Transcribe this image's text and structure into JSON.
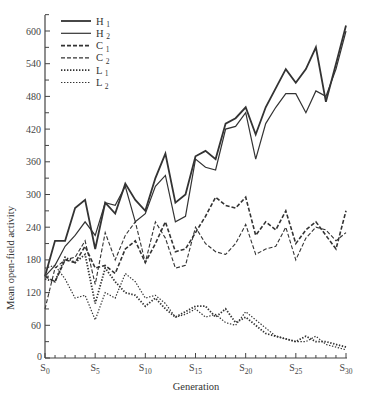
{
  "chart_data": {
    "type": "line",
    "title": "",
    "xlabel": "Generation",
    "ylabel": "Mean open-field activity",
    "x": [
      0,
      1,
      2,
      3,
      4,
      5,
      6,
      7,
      8,
      9,
      10,
      11,
      12,
      13,
      14,
      15,
      16,
      17,
      18,
      19,
      20,
      21,
      22,
      23,
      24,
      25,
      26,
      27,
      28,
      29,
      30
    ],
    "x_tick_labels": [
      {
        "g": 0,
        "base": "S",
        "sub": "0"
      },
      {
        "g": 5,
        "base": "S",
        "sub": "5"
      },
      {
        "g": 10,
        "base": "S",
        "sub": "10"
      },
      {
        "g": 15,
        "base": "S",
        "sub": "15"
      },
      {
        "g": 20,
        "base": "S",
        "sub": "20"
      },
      {
        "g": 25,
        "base": "S",
        "sub": "25"
      },
      {
        "g": 30,
        "base": "S",
        "sub": "30"
      }
    ],
    "y_ticks_labeled": [
      0,
      60,
      120,
      180,
      240,
      300,
      360,
      420,
      480,
      540,
      600
    ],
    "y_ticks_minor": [
      30,
      90,
      150,
      210,
      270,
      330,
      390,
      450,
      510,
      570,
      630
    ],
    "ylim": [
      0,
      640
    ],
    "xlim": [
      0,
      30
    ],
    "grid": false,
    "legend_position": "upper-left",
    "series": [
      {
        "name": "H1",
        "label_base": "H",
        "label_sub": "1",
        "style": "solid",
        "width": 1.8,
        "values": [
          150,
          215,
          215,
          275,
          290,
          200,
          285,
          265,
          320,
          290,
          270,
          330,
          375,
          285,
          300,
          370,
          380,
          365,
          430,
          440,
          460,
          410,
          460,
          495,
          530,
          505,
          530,
          570,
          470,
          540,
          610
        ]
      },
      {
        "name": "H2",
        "label_base": "H",
        "label_sub": "2",
        "style": "solid",
        "width": 1.2,
        "values": [
          150,
          170,
          205,
          225,
          250,
          225,
          285,
          280,
          315,
          250,
          265,
          315,
          335,
          250,
          260,
          365,
          350,
          345,
          420,
          425,
          450,
          365,
          430,
          460,
          485,
          485,
          450,
          490,
          480,
          530,
          600
        ]
      },
      {
        "name": "C1",
        "label_base": "C",
        "label_sub": "1",
        "style": "dashed",
        "width": 1.6,
        "values": [
          150,
          140,
          180,
          175,
          205,
          165,
          170,
          155,
          200,
          215,
          175,
          210,
          250,
          195,
          200,
          230,
          260,
          295,
          280,
          275,
          295,
          225,
          250,
          235,
          270,
          210,
          235,
          250,
          225,
          200,
          270
        ]
      },
      {
        "name": "C2",
        "label_base": "C",
        "label_sub": "2",
        "style": "dashed",
        "width": 1.1,
        "values": [
          90,
          165,
          180,
          185,
          215,
          135,
          230,
          180,
          225,
          250,
          175,
          250,
          220,
          165,
          170,
          240,
          210,
          195,
          190,
          210,
          245,
          190,
          200,
          205,
          240,
          180,
          220,
          240,
          235,
          215,
          230
        ]
      },
      {
        "name": "L1",
        "label_base": "L",
        "label_sub": "1",
        "style": "dotted",
        "width": 1.8,
        "values": [
          145,
          140,
          185,
          175,
          190,
          100,
          165,
          140,
          120,
          115,
          95,
          110,
          90,
          75,
          85,
          95,
          95,
          75,
          90,
          65,
          75,
          60,
          45,
          40,
          35,
          30,
          40,
          30,
          30,
          25,
          20
        ]
      },
      {
        "name": "L2",
        "label_base": "L",
        "label_sub": "2",
        "style": "dotted",
        "width": 1.2,
        "values": [
          165,
          170,
          145,
          110,
          115,
          70,
          120,
          110,
          155,
          140,
          110,
          115,
          100,
          75,
          80,
          90,
          75,
          80,
          65,
          60,
          85,
          70,
          55,
          40,
          35,
          30,
          30,
          40,
          25,
          20,
          15
        ]
      }
    ]
  },
  "colors": {
    "line": "#333333",
    "axis": "#444444",
    "background": "#ffffff"
  }
}
